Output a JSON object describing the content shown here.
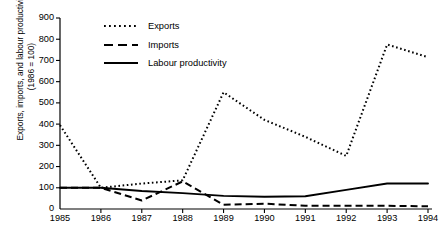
{
  "chart_data": {
    "type": "line",
    "title": "",
    "xlabel": "",
    "ylabel": "Exports, imports, and labour productivity\n(1986 = 100)",
    "x": [
      1985,
      1986,
      1987,
      1988,
      1989,
      1990,
      1991,
      1992,
      1993,
      1994
    ],
    "xticklabels": [
      "1985",
      "1986",
      "1987",
      "1988",
      "1989",
      "1990",
      "1991",
      "1992",
      "1993",
      "1994"
    ],
    "yticklabels": [
      "0",
      "100",
      "200",
      "300",
      "400",
      "500",
      "600",
      "700",
      "800",
      "900"
    ],
    "yticks": [
      0,
      100,
      200,
      300,
      400,
      500,
      600,
      700,
      800,
      900
    ],
    "ylim": [
      0,
      900
    ],
    "xlim": [
      1985,
      1994
    ],
    "grid": false,
    "legend_position": "upper-left-inside",
    "series": [
      {
        "name": "Exports",
        "style": "dotted",
        "color": "#000000",
        "values": [
          395,
          100,
          120,
          135,
          550,
          420,
          340,
          250,
          775,
          715
        ]
      },
      {
        "name": "Imports",
        "style": "dashed",
        "color": "#000000",
        "values": [
          100,
          100,
          40,
          130,
          20,
          25,
          15,
          15,
          15,
          13
        ]
      },
      {
        "name": "Labour productivity",
        "style": "solid",
        "color": "#000000",
        "values": [
          100,
          100,
          85,
          75,
          62,
          58,
          60,
          90,
          120,
          120
        ]
      }
    ]
  },
  "legend": {
    "items": [
      {
        "label": "Exports",
        "style": "dotted"
      },
      {
        "label": "Imports",
        "style": "dashed"
      },
      {
        "label": "Labour productivity",
        "style": "solid"
      }
    ]
  }
}
